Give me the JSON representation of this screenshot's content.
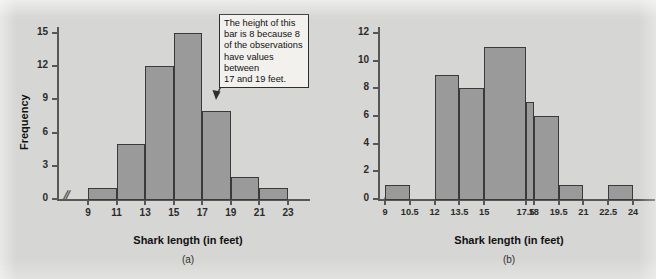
{
  "figure": {
    "background_color": "#d6d6d4",
    "bar_fill_color": "#9a9a9a",
    "bar_border_color": "#3a3a3a",
    "axis_color": "#575757",
    "axis_break_symbol": "//"
  },
  "panels": [
    {
      "id": "a",
      "caption": "(a)",
      "annotation": {
        "lines": [
          "The height of this",
          "bar is 8 because 8",
          "of the observations",
          "have values between",
          "17 and 19 feet."
        ],
        "text": "The height of this bar is 8 because 8 of the observations have values between 17 and 19 feet."
      }
    },
    {
      "id": "b",
      "caption": "(b)",
      "annotation": null
    }
  ],
  "chart_data": [
    {
      "type": "bar",
      "panel": "a",
      "title": "",
      "xlabel": "Shark length (in feet)",
      "ylabel": "Frequency",
      "bin_edges": [
        9,
        11,
        13,
        15,
        17,
        19,
        21,
        23
      ],
      "categories": [
        "9-11",
        "11-13",
        "13-15",
        "15-17",
        "17-19",
        "19-21",
        "21-23"
      ],
      "values": [
        1,
        5,
        12,
        15,
        8,
        2,
        1
      ],
      "xticks": [
        "9",
        "11",
        "13",
        "15",
        "17",
        "19",
        "21",
        "23"
      ],
      "xtick_values": [
        9,
        11,
        13,
        15,
        17,
        19,
        21,
        23
      ],
      "yticks": [
        "0",
        "3",
        "6",
        "9",
        "12",
        "15"
      ],
      "ytick_values": [
        0,
        3,
        6,
        9,
        12,
        15
      ],
      "ylim": [
        0,
        16
      ],
      "grid": false,
      "legend": false,
      "axis_break_x": true
    },
    {
      "type": "bar",
      "panel": "b",
      "title": "",
      "xlabel": "Shark length (in feet)",
      "ylabel": "Frequency",
      "bin_edges": [
        9,
        10.5,
        12,
        13.5,
        15,
        17.5,
        18,
        19.5,
        21,
        22.5,
        24
      ],
      "categories": [
        "9-10.5",
        "10.5-12",
        "12-13.5",
        "13.5-15",
        "15-17.5",
        "17.5-18",
        "18-19.5",
        "19.5-21",
        "21-22.5",
        "22.5-24"
      ],
      "values": [
        1,
        0,
        9,
        8,
        11,
        7,
        6,
        1,
        0,
        1
      ],
      "xticks": [
        "9",
        "10.5",
        "12",
        "13.5",
        "15",
        "17.5",
        "18",
        "19.5",
        "21",
        "22.5",
        "24"
      ],
      "xtick_values": [
        9,
        10.5,
        12,
        13.5,
        15,
        17.5,
        18,
        19.5,
        21,
        22.5,
        24
      ],
      "yticks": [
        "0",
        "2",
        "4",
        "6",
        "8",
        "10",
        "12"
      ],
      "ytick_values": [
        0,
        2,
        4,
        6,
        8,
        10,
        12
      ],
      "ylim": [
        0,
        12.8
      ],
      "grid": false,
      "legend": false,
      "axis_break_x": true
    }
  ]
}
